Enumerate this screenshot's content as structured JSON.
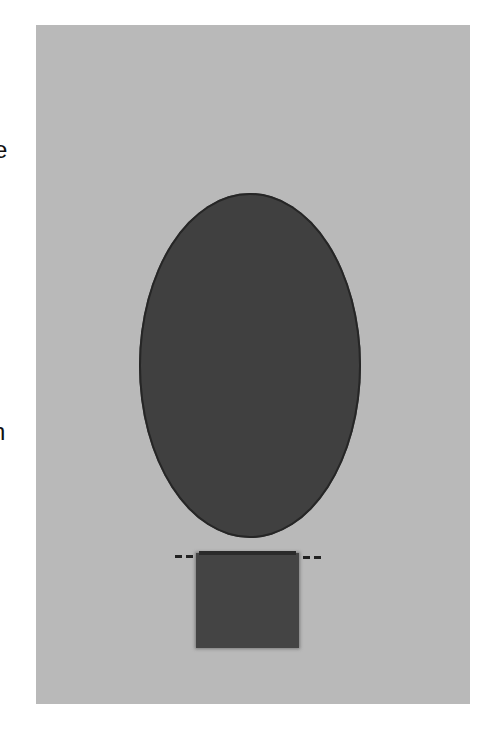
{
  "edge_text": {
    "fragment_top": "e",
    "fragment_bottom": "n"
  },
  "figure": {
    "background_color": "#ffffff",
    "panel_color": "#b9b9b9",
    "ellipse": {
      "label": "oval",
      "fill": "#404040"
    },
    "rectangle": {
      "label": "rectangle",
      "fill": "#444444"
    },
    "dashed_line": {
      "label": "fold line",
      "color": "#222222"
    }
  }
}
